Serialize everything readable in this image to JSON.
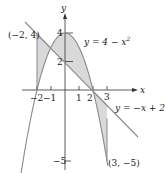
{
  "figure": {
    "axes": {
      "x_label": "x",
      "y_label": "y",
      "x_ticks": [
        {
          "value": -2,
          "label": "−2"
        },
        {
          "value": -1,
          "label": "−1"
        },
        {
          "value": 1,
          "label": "1"
        },
        {
          "value": 2,
          "label": "2"
        },
        {
          "value": 3,
          "label": "3"
        }
      ],
      "y_ticks": [
        {
          "value": 4,
          "label": "4"
        },
        {
          "value": 2,
          "label": "2"
        },
        {
          "value": -5,
          "label": "−5"
        }
      ]
    },
    "curves": [
      {
        "name": "parabola",
        "label": "y = 4 − x²",
        "label_main": "y = 4 − x",
        "label_sup": "2"
      },
      {
        "name": "line",
        "label": "y = −x + 2"
      }
    ],
    "points": [
      {
        "label": "(−2, 4)",
        "x": -2,
        "y": 4
      },
      {
        "label": "(3, −5)",
        "x": 3,
        "y": -5
      }
    ],
    "shaded_regions": [
      {
        "from_x": -2,
        "to_x": -1,
        "between": [
          "line",
          "parabola"
        ]
      },
      {
        "from_x": -1,
        "to_x": 2,
        "between": [
          "parabola",
          "line"
        ]
      },
      {
        "from_x": 2,
        "to_x": 3,
        "between": [
          "line",
          "parabola"
        ]
      }
    ],
    "colors": {
      "curve": "#8a8a8a",
      "axis": "#333333",
      "fill": "#d9d9d9"
    }
  }
}
